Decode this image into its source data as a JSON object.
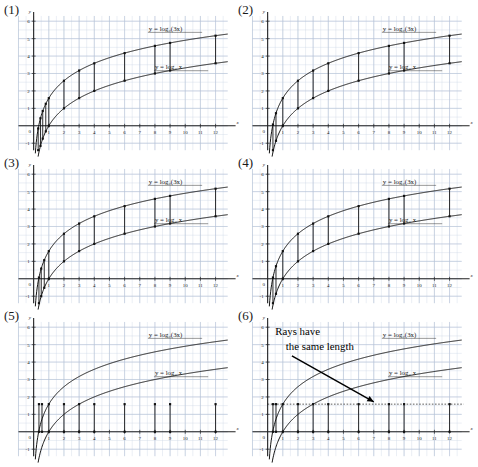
{
  "figure": {
    "title": "",
    "panel_count": 6,
    "axis": {
      "x_label": "x",
      "y_label": "y",
      "x_ticks": [
        "0",
        "1",
        "2",
        "3",
        "4",
        "5",
        "6",
        "7",
        "8",
        "9",
        "10",
        "11",
        "12"
      ],
      "y_ticks": [
        "-1",
        "1",
        "2",
        "3",
        "4",
        "5",
        "6"
      ],
      "x_min": -1.0,
      "x_max": 12.8,
      "y_min": -1.4,
      "y_max": 6.3,
      "grid": "minor grid every 0.5 units, light blue"
    },
    "colors": {
      "grid_minor": "#cdd7e6",
      "grid_major": "#b4c2d6",
      "axis": "#222222",
      "curve": "#111111",
      "ray": "#111111",
      "text": "#1a1a1a",
      "annotation": "#000000"
    },
    "curves": [
      {
        "name": "upper-curve",
        "label": "y = log₂(3x)",
        "expr": "log2(3x)"
      },
      {
        "name": "lower-curve",
        "label": "y = log₂ x",
        "expr": "log2(x)"
      }
    ],
    "constant_gap": 1.585,
    "gap_note": "log₂ 3 ≈ 1.585"
  },
  "panels": [
    {
      "id": "panel-1",
      "label": "(1)",
      "upper_label": "y = log₂(3x)",
      "lower_label": "y = log₂ x",
      "ray_mode": "between-curves",
      "ray_x": [
        0.3,
        0.45,
        0.6,
        0.8,
        1.0,
        2,
        3,
        4,
        6,
        8,
        9,
        12
      ],
      "annotation": null,
      "dotted_line_y": null
    },
    {
      "id": "panel-2",
      "label": "(2)",
      "upper_label": "y = log₂(3x)",
      "lower_label": "y = log₂ x",
      "ray_mode": "between-curves",
      "ray_x": [
        0.35,
        0.55,
        1.0,
        2,
        3,
        4,
        6,
        8,
        9,
        12
      ],
      "annotation": null,
      "dotted_line_y": null
    },
    {
      "id": "panel-3",
      "label": "(3)",
      "upper_label": "y = log₂(3x)",
      "lower_label": "y = log₂ x",
      "ray_mode": "between-curves",
      "ray_x": [
        0.35,
        0.5,
        0.7,
        1.0,
        2,
        3,
        4,
        6,
        8,
        9,
        12
      ],
      "annotation": null,
      "dotted_line_y": null
    },
    {
      "id": "panel-4",
      "label": "(4)",
      "upper_label": "y = log₂(3x)",
      "lower_label": "y = log₂ x",
      "ray_mode": "between-curves",
      "ray_x": [
        0.35,
        0.55,
        1.0,
        2,
        3,
        4,
        6,
        8,
        9,
        12
      ],
      "annotation": null,
      "dotted_line_y": null
    },
    {
      "id": "panel-5",
      "label": "(5)",
      "upper_label": "y = log₂(3x)",
      "lower_label": "y = log₂ x",
      "ray_mode": "from-axis",
      "ray_x": [
        0.35,
        0.55,
        1.0,
        2,
        3,
        4,
        6,
        8,
        9,
        12
      ],
      "annotation": null,
      "dotted_line_y": null
    },
    {
      "id": "panel-6",
      "label": "(6)",
      "upper_label": "y = log₂(3x)",
      "lower_label": "y = log₂ x",
      "ray_mode": "from-axis",
      "ray_x": [
        0.35,
        0.55,
        1.0,
        2,
        3,
        4,
        6,
        8,
        9,
        12
      ],
      "annotation": {
        "line1": "Rays have",
        "line2": "the same length",
        "arrow": "arrow pointing down-right to the rays"
      },
      "dotted_line_y": 1.585
    }
  ],
  "chart_data": {
    "type": "line",
    "title": "",
    "xlabel": "x",
    "ylabel": "y",
    "xlim": [
      -1.0,
      12.8
    ],
    "ylim": [
      -1.4,
      6.3
    ],
    "grid": true,
    "legend": "inline curve labels",
    "x": [
      0.25,
      0.5,
      0.75,
      1,
      2,
      3,
      4,
      5,
      6,
      7,
      8,
      9,
      10,
      11,
      12
    ],
    "series": [
      {
        "name": "y = log₂(3x)",
        "values": [
          -0.415,
          0.585,
          1.17,
          1.585,
          2.585,
          3.17,
          3.585,
          3.907,
          4.17,
          4.392,
          4.585,
          4.755,
          4.907,
          5.044,
          5.17
        ]
      },
      {
        "name": "y = log₂ x",
        "values": [
          -2.0,
          -1.0,
          -0.415,
          0,
          1.0,
          1.585,
          2.0,
          2.322,
          2.585,
          2.807,
          3.0,
          3.17,
          3.322,
          3.459,
          3.585
        ]
      }
    ],
    "annotations": [
      {
        "text": "Rays have the same length",
        "panel": "(6)"
      },
      {
        "text": "vertical gap = log₂ 3 ≈ 1.585 (constant for all x)",
        "panel": "all"
      }
    ]
  }
}
